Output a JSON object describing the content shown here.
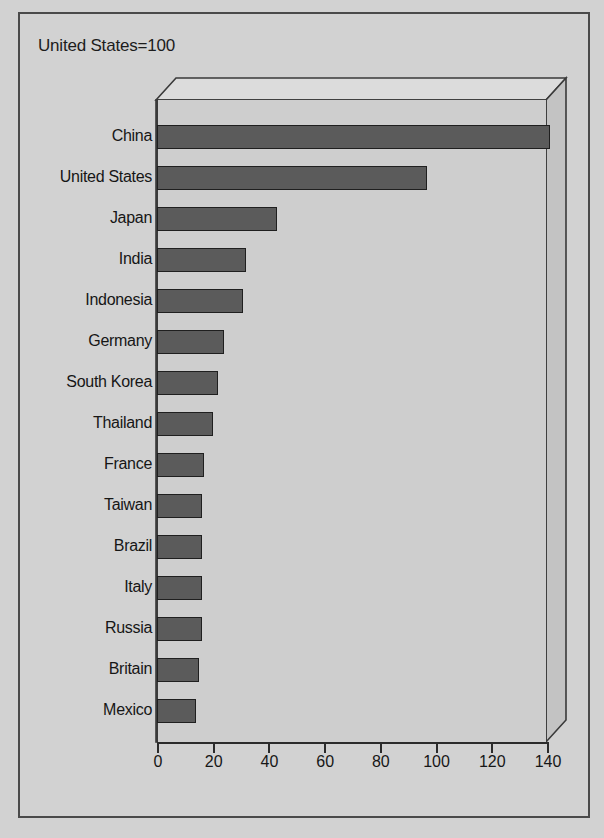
{
  "chart_data": {
    "type": "bar",
    "orientation": "horizontal",
    "title": "United States=100",
    "xlabel": "",
    "ylabel": "",
    "xlim": [
      0,
      140
    ],
    "xticks": [
      0,
      20,
      40,
      60,
      80,
      100,
      120,
      140
    ],
    "grid": false,
    "legend": null,
    "style": "3d-horizontal-bar",
    "categories": [
      "China",
      "United States",
      "Japan",
      "India",
      "Indonesia",
      "Germany",
      "South Korea",
      "Thailand",
      "France",
      "Taiwan",
      "Brazil",
      "Italy",
      "Russia",
      "Britain",
      "Mexico"
    ],
    "values": [
      141,
      97,
      43,
      32,
      31,
      24,
      22,
      20,
      17,
      16,
      16,
      16,
      16,
      15,
      14
    ],
    "bars": [
      {
        "label": "China",
        "value": 141
      },
      {
        "label": "United States",
        "value": 97
      },
      {
        "label": "Japan",
        "value": 43
      },
      {
        "label": "India",
        "value": 32
      },
      {
        "label": "Indonesia",
        "value": 31
      },
      {
        "label": "Germany",
        "value": 24
      },
      {
        "label": "South Korea",
        "value": 22
      },
      {
        "label": "Thailand",
        "value": 20
      },
      {
        "label": "France",
        "value": 17
      },
      {
        "label": "Taiwan",
        "value": 16
      },
      {
        "label": "Brazil",
        "value": 16
      },
      {
        "label": "Italy",
        "value": 16
      },
      {
        "label": "Russia",
        "value": 16
      },
      {
        "label": "Britain",
        "value": 15
      },
      {
        "label": "Mexico",
        "value": 14
      }
    ]
  },
  "colors": {
    "bar_fill": "#5b5b5b",
    "bar_edge": "#1f1f1f",
    "plot_background": "#cecece",
    "figure_background": "#d2d2d2",
    "wall_top": "#dcdcdc",
    "wall_side": "#c3c3c3",
    "axis": "#2b2b2b",
    "frame": "#4a4a4a",
    "text": "#161616"
  }
}
